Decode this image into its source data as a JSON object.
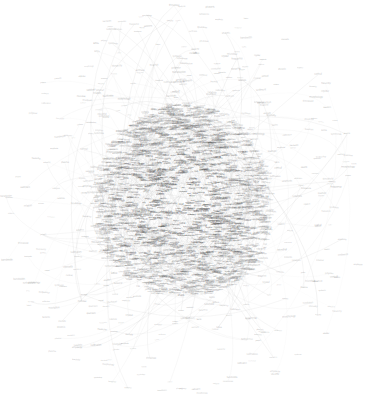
{
  "visualization": {
    "kind": "force-directed-network-graph",
    "title": "Network Graph",
    "background_color": "#ffffff",
    "node_label_color": "#3a3a3a",
    "edge_color": "#b9b9b9",
    "core_density_color": "#8a8a8a",
    "width": 373,
    "height": 405,
    "center_x": 183,
    "center_y": 200,
    "core_radius_x": 95,
    "core_radius_y": 110,
    "node_count_approx": 2400,
    "edge_count_approx": 620,
    "layout": "force-directed hairball, dense elliptical core thinning radially to sparse outliers"
  },
  "chart_data": {
    "type": "scatter",
    "title": "",
    "xlabel": "",
    "ylabel": "",
    "grid": false,
    "legend": null,
    "xlim": [
      0,
      373
    ],
    "ylim": [
      0,
      405
    ]
  },
  "nodes": {
    "vocabulary": [
      "network",
      "system",
      "model",
      "data",
      "analysis",
      "method",
      "cluster",
      "graph",
      "node",
      "edge",
      "vertex",
      "degree",
      "path",
      "link",
      "weight",
      "random",
      "theory",
      "structure",
      "dynamic",
      "complex",
      "social",
      "protein",
      "gene",
      "cell",
      "neural",
      "brain",
      "memory",
      "signal",
      "process",
      "state",
      "energy",
      "phase",
      "transition",
      "critical",
      "scaling",
      "power",
      "law",
      "distribution",
      "entropy",
      "information",
      "control",
      "optimal",
      "learning",
      "feature",
      "vector",
      "matrix",
      "algorithm",
      "search",
      "optimization",
      "function",
      "variable",
      "parameter",
      "estimate",
      "sample",
      "statistic",
      "probability",
      "bayesian",
      "inference",
      "prediction",
      "classification",
      "regression",
      "kernel",
      "support",
      "machine",
      "deep",
      "layer",
      "weight",
      "training",
      "validation",
      "accuracy",
      "error",
      "loss",
      "gradient",
      "descent",
      "convergence",
      "stability",
      "robust",
      "noise",
      "filter",
      "spectral",
      "eigenvalue",
      "laplacian",
      "modularity",
      "community",
      "centrality",
      "betweenness",
      "closeness",
      "pagerank",
      "diffusion",
      "epidemic",
      "spread",
      "contagion",
      "cascade",
      "threshold",
      "percolation",
      "synchronization",
      "oscillator",
      "coupling",
      "attractor",
      "chaos",
      "bifurcation",
      "equilibrium",
      "stochastic",
      "markov",
      "chain",
      "walk",
      "diffusive",
      "transport",
      "flow",
      "capacity",
      "bottleneck",
      "routing",
      "traffic",
      "congestion",
      "resilience",
      "failure",
      "cascade",
      "attack",
      "vulnerability",
      "security",
      "privacy",
      "trust",
      "reputation",
      "collaboration",
      "citation",
      "author",
      "paper",
      "journal",
      "impact",
      "influence",
      "opinion",
      "consensus",
      "polarization",
      "segregation",
      "mobility",
      "migration",
      "urban",
      "spatial",
      "temporal",
      "evolution",
      "growth",
      "preferential",
      "attachment",
      "smallworld",
      "scalefree",
      "motif",
      "pattern",
      "topology",
      "geometry",
      "embedding",
      "dimension",
      "manifold",
      "metric",
      "distance",
      "similarity",
      "correlation",
      "causality",
      "coupling",
      "interaction",
      "ecology",
      "species",
      "food",
      "web",
      "metabolic",
      "regulatory",
      "transcription",
      "expression",
      "sequence",
      "genome",
      "mutation",
      "selection",
      "fitness",
      "landscape",
      "adaptation",
      "emergence",
      "collective",
      "swarm",
      "agent",
      "behavior",
      "game",
      "strategy",
      "cooperation",
      "defection",
      "payoff",
      "nash",
      "market",
      "economic",
      "trade",
      "finance",
      "risk",
      "portfolio",
      "volatility",
      "crisis",
      "bank",
      "credit",
      "supply",
      "chain",
      "logistics",
      "energy",
      "grid",
      "power",
      "renewable",
      "climate",
      "carbon",
      "emission",
      "transport",
      "internet",
      "web",
      "hyperlink",
      "search",
      "crawl",
      "semantic",
      "ontology",
      "knowledge",
      "concept",
      "word",
      "language",
      "corpus",
      "topic",
      "document",
      "text",
      "mining",
      "sentiment"
    ],
    "outlier_labels": [
      "cortical",
      "relation",
      "frequency",
      "threshold",
      "synthesis",
      "amplitude",
      "bandwidth",
      "hierarchy",
      "resolution",
      "calibration",
      "morphology",
      "transduction",
      "microbial",
      "catalysis",
      "polymer",
      "lattice",
      "crystal",
      "quantum",
      "photonic",
      "plasma",
      "turbulence",
      "viscosity",
      "sediment",
      "aquifer",
      "tectonic"
    ]
  },
  "labels": {
    "empty_state": ""
  }
}
